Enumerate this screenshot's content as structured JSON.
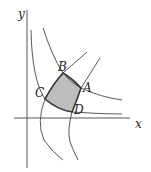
{
  "diagram": {
    "axes": {
      "x_label": "x",
      "y_label": "y"
    },
    "points": [
      {
        "label": "A",
        "x": 81,
        "y": 88,
        "lx": 83,
        "ly": 90
      },
      {
        "label": "B",
        "x": 63,
        "y": 73,
        "lx": 58,
        "ly": 70
      },
      {
        "label": "C",
        "x": 45,
        "y": 99,
        "lx": 36,
        "ly": 96
      },
      {
        "label": "D",
        "x": 72,
        "y": 112,
        "lx": 74,
        "ly": 113
      }
    ],
    "region": {
      "fill": "#bdbdbd",
      "stroke": "#333333",
      "description": "shaded region bounded by curves through A, B, C, D"
    },
    "colors": {
      "curve": "#444444",
      "axis": "#555555"
    }
  }
}
